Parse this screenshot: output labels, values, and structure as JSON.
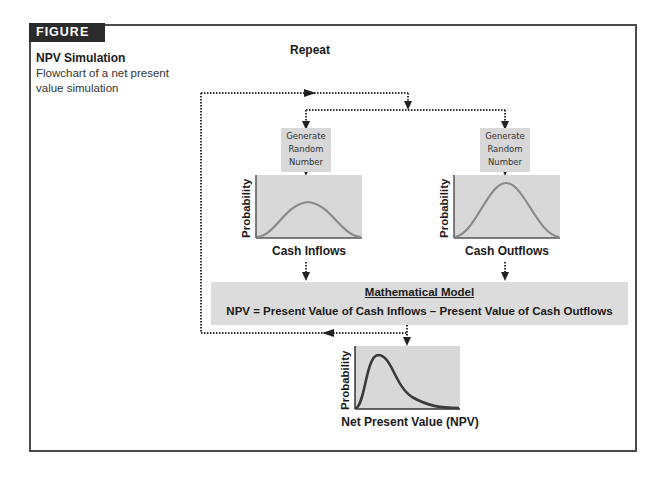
{
  "figure": {
    "label": "FIGURE 12.1",
    "title": "NPV Simulation",
    "caption": "Flowchart of a net present value simulation"
  },
  "flowchart": {
    "loop_label": "Repeat",
    "generators": [
      {
        "label": "Generate Random Number"
      },
      {
        "label": "Generate Random Number"
      }
    ],
    "distributions": [
      {
        "y_label": "Probability",
        "x_label": "Cash Inflows",
        "shape": "symmetric-bell-low"
      },
      {
        "y_label": "Probability",
        "x_label": "Cash Outflows",
        "shape": "symmetric-bell-high"
      }
    ],
    "model": {
      "title": "Mathematical Model",
      "equation": "NPV = Present Value of Cash Inflows – Present Value of Cash Outflows"
    },
    "output": {
      "y_label": "Probability",
      "x_label": "Net Present Value (NPV)",
      "shape": "right-skewed"
    }
  },
  "colors": {
    "badge_bg": "#2b2b2b",
    "box_fill": "#d8d8d8",
    "curve_light": "#8a8a8a",
    "curve_dark": "#3a3a3a",
    "frame": "#4a4a4a"
  }
}
